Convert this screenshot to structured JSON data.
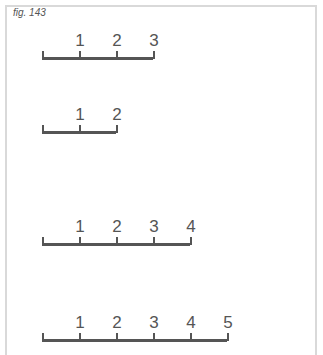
{
  "figure": {
    "caption": "fig. 143",
    "rulers": [
      {
        "labels": [
          "1",
          "2",
          "3"
        ],
        "y": 58,
        "x0": 42,
        "step": 37
      },
      {
        "labels": [
          "1",
          "2"
        ],
        "y": 132,
        "x0": 42,
        "step": 37
      },
      {
        "labels": [
          "1",
          "2",
          "3",
          "4"
        ],
        "y": 244,
        "x0": 42,
        "step": 37
      },
      {
        "labels": [
          "1",
          "2",
          "3",
          "4",
          "5"
        ],
        "y": 340,
        "x0": 42,
        "step": 37
      }
    ]
  }
}
